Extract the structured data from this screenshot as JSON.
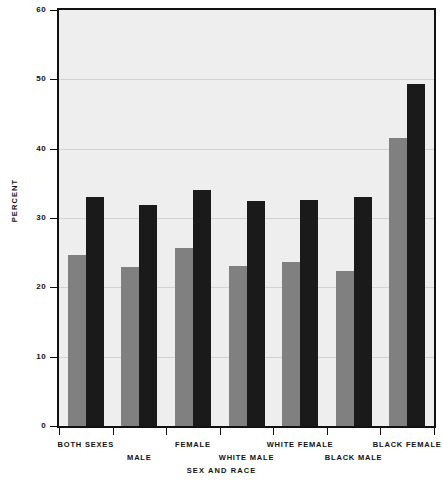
{
  "chart_data": {
    "type": "bar",
    "title": "",
    "xlabel": "Sex and Race",
    "ylabel": "Percent",
    "ylim": [
      0,
      60
    ],
    "yticks": [
      0,
      10,
      20,
      30,
      40,
      50,
      60
    ],
    "grid": true,
    "legend": "none",
    "categories": [
      "Both Sexes",
      "Male",
      "Female",
      "White Male",
      "White Female",
      "Black Male",
      "Black Female"
    ],
    "series": [
      {
        "name": "series-1",
        "color": "#808080",
        "values": [
          24.6,
          23.0,
          25.7,
          23.1,
          23.6,
          22.3,
          41.6
        ]
      },
      {
        "name": "series-2",
        "color": "#1a1a1a",
        "values": [
          33.1,
          31.9,
          34.1,
          32.4,
          32.6,
          33.0,
          49.3
        ]
      }
    ]
  },
  "axes": {
    "y_tick_labels": [
      "0",
      "10",
      "20",
      "30",
      "40",
      "50",
      "60"
    ],
    "y_axis_title": "Percent",
    "x_axis_title": "Sex and Race"
  },
  "colors": {
    "plot_background": "#eeeeee",
    "frame": "#111111",
    "gridline": "#d3d3d3",
    "bar_gray": "#808080",
    "bar_black": "#1a1a1a",
    "text": "#111111"
  }
}
